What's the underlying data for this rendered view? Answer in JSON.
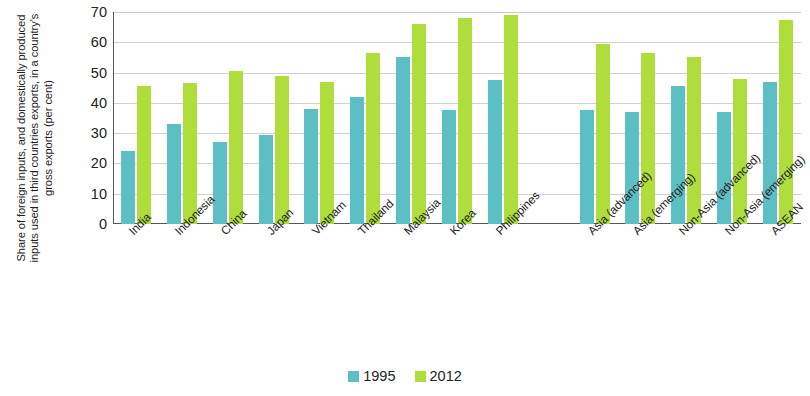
{
  "chart_data": {
    "type": "bar",
    "title": "",
    "xlabel": "",
    "ylabel": "Share of foreign inputs, and domestically produced inputs used in third countries exports, in a country's gross exports (per cent)",
    "ylim": [
      0,
      70
    ],
    "ytick_values": [
      0,
      10,
      20,
      30,
      40,
      50,
      60,
      70
    ],
    "ytick_labels": [
      "0",
      "10",
      "20",
      "30",
      "40",
      "50",
      "60",
      "70"
    ],
    "grid": true,
    "legend_position": "bottom-center",
    "categories": [
      "India",
      "Indonesia",
      "China",
      "Japan",
      "Vietnam",
      "Thailand",
      "Malaysia",
      "Korea",
      "Philippines",
      "",
      "Asia (advanced)",
      "Asia (emerging)",
      "Non-Asia (advanced)",
      "Non-Asia (emerging)",
      "ASEAN"
    ],
    "series": [
      {
        "name": "1995",
        "color": "#5bbfc4",
        "values": [
          24,
          33,
          27,
          29.5,
          38,
          42,
          55,
          37.5,
          47.5,
          null,
          37.5,
          37,
          45.5,
          37,
          47
        ]
      },
      {
        "name": "2012",
        "color": "#aedd3c",
        "values": [
          45.5,
          46.5,
          50.5,
          49,
          47,
          56.5,
          66,
          68,
          69,
          null,
          59.5,
          56.5,
          55,
          48,
          67.5
        ]
      }
    ]
  },
  "legend": {
    "items": [
      {
        "label": "1995",
        "color": "#5bbfc4"
      },
      {
        "label": "2012",
        "color": "#aedd3c"
      }
    ]
  }
}
